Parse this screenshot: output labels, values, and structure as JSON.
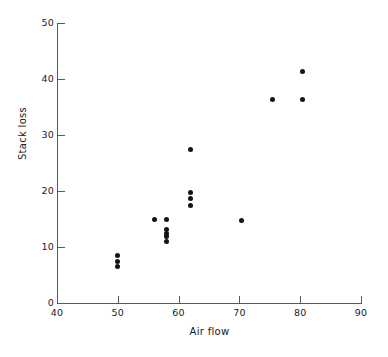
{
  "chart_data": {
    "type": "scatter",
    "title": "",
    "xlabel": "Air flow",
    "ylabel": "Stack loss",
    "xlim": [
      40,
      90
    ],
    "ylim": [
      0,
      50
    ],
    "xticks": [
      40,
      50,
      60,
      70,
      80,
      90
    ],
    "yticks": [
      0,
      10,
      20,
      30,
      40,
      50
    ],
    "grid": false,
    "legend": null,
    "marker": "filled-circle",
    "marker_color": "#141414",
    "axis_color": "#59595b",
    "background": "#ffffff",
    "points": [
      {
        "x": 50.0,
        "y": 6.5
      },
      {
        "x": 50.0,
        "y": 7.5
      },
      {
        "x": 50.0,
        "y": 8.5
      },
      {
        "x": 56.0,
        "y": 15.0
      },
      {
        "x": 58.0,
        "y": 11.0
      },
      {
        "x": 58.0,
        "y": 11.8
      },
      {
        "x": 58.0,
        "y": 12.5
      },
      {
        "x": 58.0,
        "y": 13.2
      },
      {
        "x": 58.0,
        "y": 15.0
      },
      {
        "x": 62.0,
        "y": 17.5
      },
      {
        "x": 62.0,
        "y": 18.7
      },
      {
        "x": 62.0,
        "y": 19.8
      },
      {
        "x": 62.0,
        "y": 27.5
      },
      {
        "x": 70.4,
        "y": 14.8
      },
      {
        "x": 75.5,
        "y": 36.3
      },
      {
        "x": 80.4,
        "y": 36.3
      },
      {
        "x": 80.4,
        "y": 41.3
      }
    ]
  }
}
